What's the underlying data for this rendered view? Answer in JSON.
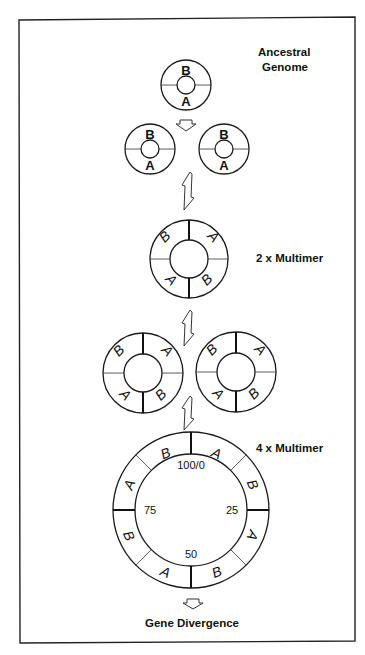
{
  "figure": {
    "frame": {
      "x": 19,
      "y": 20,
      "width": 336,
      "height": 623
    },
    "stages": [
      {
        "id": "ancestral",
        "caption_lines": [
          "Ancestral",
          "Genome"
        ]
      },
      {
        "id": "dimer",
        "caption": "2 x Multimer"
      },
      {
        "id": "tetramer",
        "caption": "4 x Multimer"
      },
      {
        "id": "divergence",
        "caption": "Gene Divergence"
      }
    ],
    "ancestral_genome": {
      "segments": [
        "B",
        "A"
      ]
    },
    "copies": [
      {
        "segments": [
          "B",
          "A"
        ]
      },
      {
        "segments": [
          "B",
          "A"
        ]
      }
    ],
    "multimer_2x": {
      "segments_clockwise_from_top": [
        "A",
        "B",
        "A",
        "B"
      ]
    },
    "multimer_2x_pair": [
      {
        "segments_clockwise_from_top": [
          "A",
          "B",
          "A",
          "B"
        ]
      },
      {
        "segments_clockwise_from_top": [
          "A",
          "B",
          "A",
          "B"
        ]
      }
    ],
    "multimer_4x": {
      "segments_clockwise_from_top": [
        "A",
        "B",
        "A",
        "B",
        "A",
        "B",
        "A",
        "B"
      ],
      "map_positions": {
        "top": "100/0",
        "right": "25",
        "bottom": "50",
        "left": "75"
      }
    },
    "arrow_icons": [
      "down-arrow-icon",
      "recombination-arrow-icon"
    ]
  }
}
